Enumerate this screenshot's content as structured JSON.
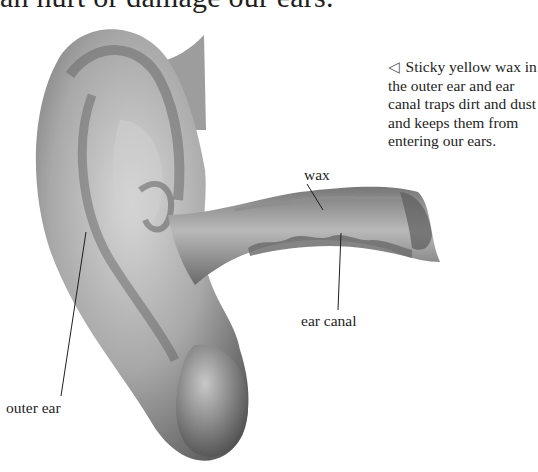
{
  "page": {
    "heading_fragment": "an hurt or damage our ears.",
    "caption": {
      "marker": "◁",
      "text": "Sticky yellow wax in the outer ear and ear canal traps dirt and dust and keeps them from entering our ears."
    },
    "labels": {
      "wax": "wax",
      "ear_canal": "ear canal",
      "outer_ear": "outer ear"
    },
    "illustration": {
      "subject": "ear-anatomy-illustration",
      "colors": {
        "skin_dark": "#5a5a5a",
        "skin_mid": "#9a9a9a",
        "skin_light": "#d6d6d6",
        "wax": "#6e6e6e",
        "line": "#1e1e1e"
      }
    }
  }
}
